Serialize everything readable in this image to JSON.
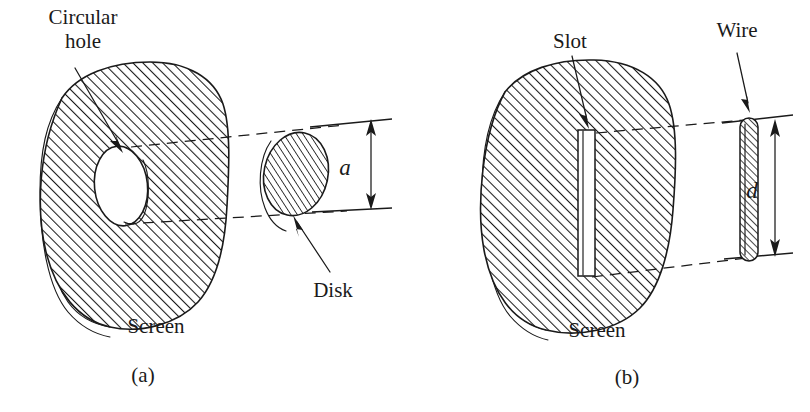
{
  "figure": {
    "background_color": "#ffffff",
    "ink_color": "#1a1a1a",
    "panels": [
      {
        "id": "a",
        "caption": "(a)",
        "screen_label": "Screen",
        "aperture_label_line1": "Circular",
        "aperture_label_line2": "hole",
        "complement_label": "Disk",
        "dimension_label": "a"
      },
      {
        "id": "b",
        "caption": "(b)",
        "screen_label": "Screen",
        "aperture_label_line1": "Slot",
        "aperture_label_line2": "",
        "complement_label": "Wire",
        "dimension_label": "d"
      }
    ]
  },
  "panel_a": {
    "label_circular": "Circular",
    "label_hole": "hole",
    "label_screen": "Screen",
    "label_disk": "Disk",
    "label_dimension": "a",
    "label_caption": "(a)"
  },
  "panel_b": {
    "label_slot": "Slot",
    "label_wire": "Wire",
    "label_screen": "Screen",
    "label_dimension": "d",
    "label_caption": "(b)"
  }
}
